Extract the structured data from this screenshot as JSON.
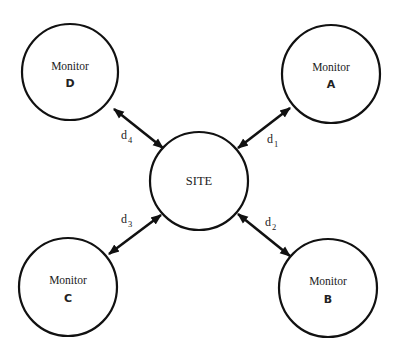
{
  "diagram": {
    "center_node": {
      "label": "SITE"
    },
    "monitors": [
      {
        "id": "A",
        "title": "Monitor",
        "letter": "A",
        "distance": {
          "base": "d",
          "sub": "1"
        }
      },
      {
        "id": "B",
        "title": "Monitor",
        "letter": "B",
        "distance": {
          "base": "d",
          "sub": "2"
        }
      },
      {
        "id": "C",
        "title": "Monitor",
        "letter": "C",
        "distance": {
          "base": "d",
          "sub": "3"
        }
      },
      {
        "id": "D",
        "title": "Monitor",
        "letter": "D",
        "distance": {
          "base": "d",
          "sub": "4"
        }
      }
    ],
    "connector": "double-headed-arrow",
    "colors": {
      "stroke": "#111111",
      "background": "#ffffff"
    }
  }
}
